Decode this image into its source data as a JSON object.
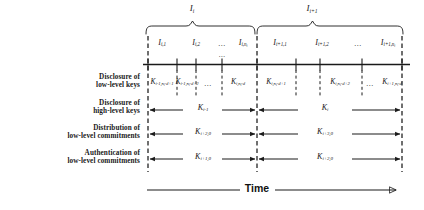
{
  "figure": {
    "type": "timeline-diagram",
    "axis_label": "Time",
    "top_intervals": [
      {
        "name": "I_i",
        "base": "I",
        "sub": "i"
      },
      {
        "name": "I_i+1",
        "base": "I",
        "sub": "i+1"
      }
    ],
    "sub_intervals": [
      {
        "base": "I",
        "sub": "i,1"
      },
      {
        "base": "I",
        "sub": "i,2"
      },
      {
        "base": "",
        "sub": "",
        "ellipsis": "..."
      },
      {
        "base": "I",
        "sub": "i,n",
        "subsub": "i"
      },
      {
        "base": "I",
        "sub": "i+1,1"
      },
      {
        "base": "I",
        "sub": "i+1,2"
      },
      {
        "base": "",
        "sub": "",
        "ellipsis": "..."
      },
      {
        "base": "I",
        "sub": "i+1,n",
        "subsub": "i"
      }
    ],
    "rows": [
      {
        "id": "disclosure-low-level-keys",
        "label_line1": "Disclosure of",
        "label_line2": "low-level keys",
        "kind": "keys",
        "keys": [
          {
            "base": "K",
            "sub": "i-1,n",
            "subsub": "i",
            "tail": "-d+1"
          },
          {
            "base": "K",
            "sub": "i-1,n",
            "subsub": "i",
            "tail": "-d+2"
          },
          {
            "ellipsis": "..."
          },
          {
            "base": "K",
            "sub": "i,n",
            "subsub": "i",
            "tail": "-d"
          },
          {
            "base": "K",
            "sub": "i,n",
            "subsub": "i",
            "tail": "-d+1"
          },
          {
            "base": "K",
            "sub": "i,n",
            "subsub": "i",
            "tail": "-d+2"
          },
          {
            "ellipsis": "..."
          },
          {
            "base": "K",
            "sub": "i+1,n",
            "subsub": "i",
            "tail": "-d"
          }
        ]
      },
      {
        "id": "disclosure-high-level-keys",
        "label_line1": "Disclosure of",
        "label_line2": "high-level keys",
        "kind": "arrows",
        "arrows": [
          {
            "base": "K",
            "sub": "i-1"
          },
          {
            "base": "K",
            "sub": "i"
          }
        ]
      },
      {
        "id": "distribution-low-level-commitments",
        "label_line1": "Distribution of",
        "label_line2": "low-level commitments",
        "kind": "arrows",
        "arrows": [
          {
            "base": "K",
            "sub": "i+2,0"
          },
          {
            "base": "K",
            "sub": "i+3,0"
          }
        ]
      },
      {
        "id": "authentication-low-level-commitments",
        "label_line1": "Authentication of",
        "label_line2": "low-level commitments",
        "kind": "arrows",
        "arrows": [
          {
            "base": "K",
            "sub": "i+1,0"
          },
          {
            "base": "K",
            "sub": "i+2,0"
          }
        ]
      }
    ],
    "colors": {
      "line": "#1a1a1a",
      "dashed": "#1a1a1a",
      "text": "#1a1a1a",
      "background": "#ffffff"
    }
  }
}
